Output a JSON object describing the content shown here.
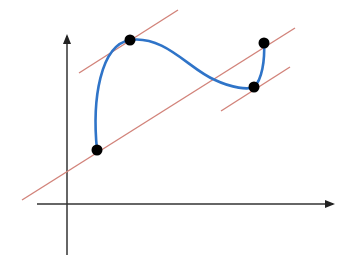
{
  "diagram": {
    "colors": {
      "axis": "#333333",
      "curve": "#2f74c8",
      "tangent": "#d2837a",
      "point": "#000000",
      "background": "#ffffff"
    },
    "axes": {
      "x_axis": {
        "x1": 37,
        "y": 204,
        "x2": 337
      },
      "y_axis": {
        "x": 67,
        "y1": 255,
        "y2": 32
      }
    },
    "points": [
      {
        "name": "start-point",
        "x": 97,
        "y": 150
      },
      {
        "name": "peak-point",
        "x": 130,
        "y": 40
      },
      {
        "name": "valley-point",
        "x": 254,
        "y": 87
      },
      {
        "name": "end-point",
        "x": 264,
        "y": 43
      }
    ],
    "tangent_lines": [
      {
        "name": "upper-tangent-line",
        "x1": 79,
        "y1": 73,
        "x2": 178,
        "y2": 10
      },
      {
        "name": "long-tangent-line",
        "x1": 22,
        "y1": 200,
        "x2": 295,
        "y2": 28
      },
      {
        "name": "lower-tangent-line",
        "x1": 221,
        "y1": 111,
        "x2": 290,
        "y2": 67
      }
    ]
  }
}
